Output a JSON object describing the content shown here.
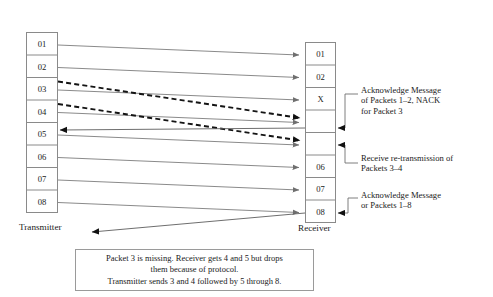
{
  "diagram": {
    "transmitter": {
      "label": "Transmitter",
      "cells": [
        "01",
        "02",
        "03",
        "04",
        "05",
        "06",
        "07",
        "08"
      ]
    },
    "receiver": {
      "label": "Receiver",
      "cells": [
        "01",
        "02",
        "X",
        "",
        "",
        "06",
        "07",
        "08"
      ]
    },
    "callouts": [
      {
        "id": "ack-nack",
        "lines": [
          "Acknowledge Message",
          "of Packets 1–2, NACK",
          "for Packet 3"
        ]
      },
      {
        "id": "retransmission",
        "lines": [
          "Receive re-transmission of",
          "Packets 3–4"
        ]
      },
      {
        "id": "final-ack",
        "lines": [
          "Acknowledge Message",
          "or Packets 1–8"
        ]
      }
    ],
    "caption": {
      "lines": [
        "Packet 3 is missing. Receiver gets 4 and 5 but drops",
        "them because of protocol.",
        "Transmitter sends 3 and 4 followed by 5 through 8."
      ]
    },
    "colors": {
      "stroke_box": "#8a8a8a",
      "stroke_arrow": "#7d7d7d",
      "stroke_dashed": "#1a1a1a",
      "text": "#1a1a1a",
      "background": "#ffffff"
    }
  }
}
